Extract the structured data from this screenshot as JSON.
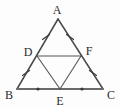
{
  "figure": {
    "canvas": {
      "width": 120,
      "height": 107
    },
    "background_color": "#fdfdfd",
    "line_color": "#4a4a4a",
    "base_line_color": "#6a6a6a",
    "inner_line_color": "#555555",
    "mark_color": "#3a3a3a",
    "label_color": "#2b2b2b"
  },
  "points": {
    "A": {
      "label": "A",
      "x": 58,
      "y": 19,
      "label_x": 57,
      "label_y": 12
    },
    "B": {
      "label": "B",
      "x": 17,
      "y": 89,
      "label_x": 9,
      "label_y": 97
    },
    "C": {
      "label": "C",
      "x": 103,
      "y": 89,
      "label_x": 110,
      "label_y": 97
    },
    "D": {
      "label": "D",
      "x": 37,
      "y": 56,
      "label_x": 28,
      "label_y": 55
    },
    "E": {
      "label": "E",
      "x": 60,
      "y": 89,
      "label_x": 60,
      "label_y": 103
    },
    "F": {
      "label": "F",
      "x": 81,
      "y": 56,
      "label_x": 89,
      "label_y": 54
    }
  },
  "segments": [
    {
      "name": "AB",
      "from": "A",
      "to": "B",
      "style": "outer"
    },
    {
      "name": "AC",
      "from": "A",
      "to": "C",
      "style": "outer"
    },
    {
      "name": "BC",
      "from": "B",
      "to": "C",
      "style": "base"
    },
    {
      "name": "DF",
      "from": "D",
      "to": "F",
      "style": "inner"
    },
    {
      "name": "DE",
      "from": "D",
      "to": "E",
      "style": "inner"
    },
    {
      "name": "EF",
      "from": "E",
      "to": "F",
      "style": "inner"
    }
  ],
  "marks": [
    {
      "name": "tick-AD",
      "segment": "AD",
      "type": "single-slash",
      "x": 46,
      "y": 37
    },
    {
      "name": "tick-DB",
      "segment": "DB",
      "type": "single-slash",
      "x": 26,
      "y": 73
    },
    {
      "name": "tick-AF",
      "segment": "AF",
      "type": "single-slash",
      "x": 70,
      "y": 37
    },
    {
      "name": "tick-FC",
      "segment": "FC",
      "type": "single-slash",
      "x": 93,
      "y": 73
    },
    {
      "name": "dot-BE",
      "segment": "BE",
      "type": "dot",
      "x": 38,
      "y": 89
    },
    {
      "name": "dot-EC",
      "segment": "EC",
      "type": "dot",
      "x": 82,
      "y": 89
    }
  ],
  "relations": {
    "equal_upper_left": "AD = DB",
    "equal_upper_right": "AF = FC",
    "equal_base": "BE = EC"
  }
}
